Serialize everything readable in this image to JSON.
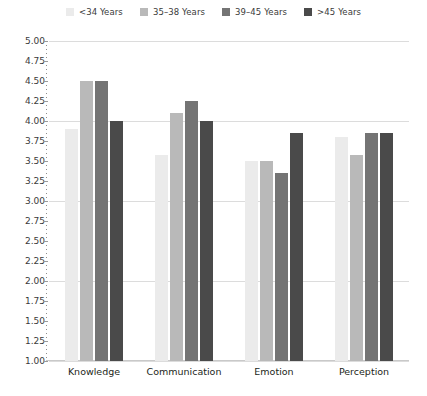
{
  "chart_data": {
    "type": "bar",
    "title": "",
    "subtitle": "",
    "xlabel": "",
    "ylabel": "",
    "ylim": [
      1.0,
      5.0
    ],
    "ytick_step": 0.25,
    "yticks": [
      "5.00",
      "4.75",
      "4.50",
      "4.25",
      "4.00",
      "3.75",
      "3.50",
      "3.25",
      "3.00",
      "2.75",
      "2.50",
      "2.25",
      "2.00",
      "1.75",
      "1.50",
      "1.25",
      "1.00"
    ],
    "gridlines_at": [
      5.0,
      4.0,
      3.0,
      2.0,
      1.0
    ],
    "grid": true,
    "legend_position": "top-center",
    "categories": [
      "Knowledge",
      "Communication",
      "Emotion",
      "Perception"
    ],
    "series": [
      {
        "name": "<34 Years",
        "color": "#ebebeb",
        "values": [
          3.9,
          3.57,
          3.5,
          3.8
        ]
      },
      {
        "name": "35–38 Years",
        "color": "#b9b9b9",
        "values": [
          4.5,
          4.1,
          3.5,
          3.58
        ]
      },
      {
        "name": "39–45 Years",
        "color": "#747474",
        "values": [
          4.5,
          4.25,
          3.35,
          3.85
        ]
      },
      {
        "name": ">45 Years",
        "color": "#4a4a4a",
        "values": [
          4.0,
          4.0,
          3.85,
          3.85
        ]
      }
    ]
  },
  "colors": {
    "background": "#ffffff",
    "gridline": "#dcdcdc",
    "axis_tick": "#9a9a9a",
    "text": "#231f20",
    "legend_text": "#3a3a3a"
  }
}
